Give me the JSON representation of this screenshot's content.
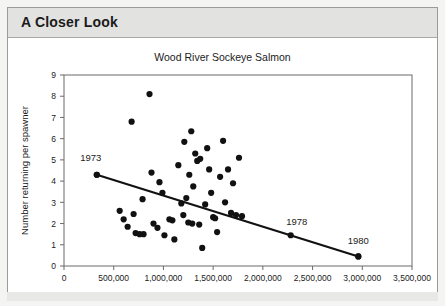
{
  "header": {
    "title": "A Closer Look"
  },
  "chart_data": {
    "type": "scatter",
    "title": "Wood River Sockeye Salmon",
    "xlabel": "Number of spawners",
    "ylabel": "Number returning per spawner",
    "xlim": [
      0,
      3500000
    ],
    "ylim": [
      0,
      9
    ],
    "xticks": [
      0,
      500000,
      1000000,
      1500000,
      2000000,
      2500000,
      3000000,
      3500000
    ],
    "xtick_labels": [
      "0",
      "500,000",
      "1,000,000",
      "1,500,000",
      "2,000,000",
      "2,500,000",
      "3,000,000",
      "3,500,000"
    ],
    "yticks": [
      0,
      1,
      2,
      3,
      4,
      5,
      6,
      7,
      8,
      9
    ],
    "ytick_labels": [
      "0",
      "1",
      "2",
      "3",
      "4",
      "5",
      "6",
      "7",
      "8",
      "9"
    ],
    "grid": false,
    "legend": "none",
    "marker_color": "#111111",
    "line_color": "#111111",
    "points": [
      [
        330000,
        4.3
      ],
      [
        560000,
        2.6
      ],
      [
        600000,
        2.2
      ],
      [
        640000,
        1.85
      ],
      [
        680000,
        6.8
      ],
      [
        700000,
        2.45
      ],
      [
        720000,
        1.55
      ],
      [
        760000,
        1.5
      ],
      [
        790000,
        3.15
      ],
      [
        800000,
        1.5
      ],
      [
        860000,
        8.1
      ],
      [
        880000,
        4.4
      ],
      [
        900000,
        2.0
      ],
      [
        940000,
        1.8
      ],
      [
        960000,
        3.95
      ],
      [
        990000,
        3.45
      ],
      [
        1010000,
        1.45
      ],
      [
        1060000,
        2.2
      ],
      [
        1090000,
        2.15
      ],
      [
        1110000,
        1.25
      ],
      [
        1150000,
        4.75
      ],
      [
        1180000,
        2.95
      ],
      [
        1200000,
        2.4
      ],
      [
        1210000,
        5.85
      ],
      [
        1230000,
        3.2
      ],
      [
        1250000,
        2.05
      ],
      [
        1260000,
        4.3
      ],
      [
        1280000,
        6.35
      ],
      [
        1290000,
        2.0
      ],
      [
        1300000,
        3.75
      ],
      [
        1320000,
        5.3
      ],
      [
        1340000,
        4.95
      ],
      [
        1360000,
        1.95
      ],
      [
        1370000,
        5.05
      ],
      [
        1390000,
        0.85
      ],
      [
        1420000,
        2.9
      ],
      [
        1440000,
        5.55
      ],
      [
        1460000,
        4.55
      ],
      [
        1480000,
        3.45
      ],
      [
        1500000,
        2.3
      ],
      [
        1520000,
        2.25
      ],
      [
        1540000,
        1.6
      ],
      [
        1570000,
        4.2
      ],
      [
        1600000,
        5.9
      ],
      [
        1620000,
        3.0
      ],
      [
        1650000,
        4.55
      ],
      [
        1680000,
        2.5
      ],
      [
        1700000,
        3.9
      ],
      [
        1730000,
        2.4
      ],
      [
        1760000,
        5.1
      ],
      [
        1790000,
        2.35
      ],
      [
        2280000,
        1.45
      ],
      [
        2960000,
        0.45
      ]
    ],
    "trendline": {
      "x0": 330000,
      "y0": 4.3,
      "x1": 2960000,
      "y1": 0.45
    },
    "annotations": [
      {
        "label": "1973",
        "x": 330000,
        "y": 4.3,
        "dx": -6,
        "dy": -14
      },
      {
        "label": "1978",
        "x": 2280000,
        "y": 1.45,
        "dx": 6,
        "dy": -10
      },
      {
        "label": "1980",
        "x": 2960000,
        "y": 0.45,
        "dx": 0,
        "dy": -12
      }
    ]
  }
}
